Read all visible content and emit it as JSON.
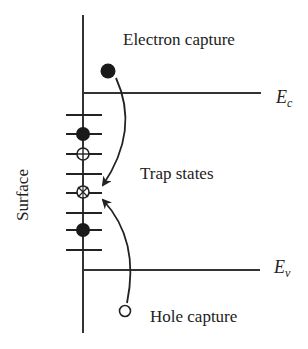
{
  "diagram": {
    "labels": {
      "electron_capture": "Electron capture",
      "trap_states": "Trap states",
      "hole_capture": "Hole capture",
      "surface": "Surface",
      "conduction_band": {
        "main": "E",
        "sub": "c"
      },
      "valence_band": {
        "main": "E",
        "sub": "v"
      }
    },
    "trap_levels": [
      {
        "y": 115,
        "occupancy": "empty"
      },
      {
        "y": 134,
        "occupancy": "electron"
      },
      {
        "y": 154,
        "occupancy": "hole"
      },
      {
        "y": 174,
        "occupancy": "empty"
      },
      {
        "y": 193,
        "occupancy": "recombination"
      },
      {
        "y": 213,
        "occupancy": "empty"
      },
      {
        "y": 230,
        "occupancy": "electron"
      },
      {
        "y": 250,
        "occupancy": "empty"
      }
    ],
    "particles": {
      "free_electron": {
        "type": "electron",
        "filled": true
      },
      "free_hole": {
        "type": "hole",
        "filled": false
      }
    },
    "arrows": [
      {
        "from": "free_electron",
        "to": "trap_states",
        "label": "Electron capture"
      },
      {
        "from": "free_hole",
        "to": "trap_states",
        "label": "Hole capture"
      }
    ],
    "colors": {
      "line": "#222222",
      "background": "#ffffff"
    }
  }
}
